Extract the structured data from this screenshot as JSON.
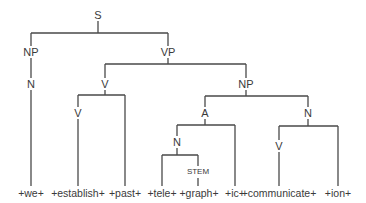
{
  "diagram": {
    "type": "syntax-tree",
    "line_color": "#4a4a4a",
    "nodes": {
      "s": "S",
      "np_subject": "NP",
      "n_subject": "N",
      "vp": "VP",
      "v_outer": "V",
      "v_inner": "V",
      "np_object": "NP",
      "a": "A",
      "n_compound": "N",
      "stem": "STEM",
      "n_right": "N",
      "v_right": "V"
    },
    "leaves": [
      "+we+",
      "+establish+",
      "+past+",
      "+tele+",
      "+graph+",
      "+ic+",
      "+communicate+",
      "+ion+"
    ]
  }
}
